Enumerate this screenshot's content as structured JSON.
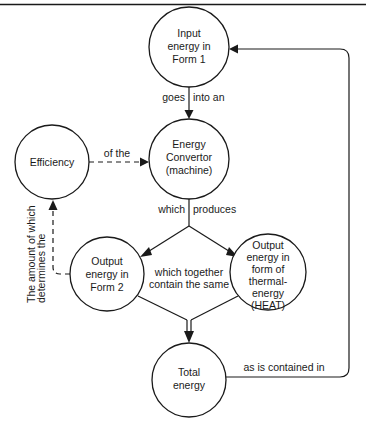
{
  "diagram": {
    "type": "concept-map",
    "nodes": [
      {
        "id": "input",
        "lines": [
          "Input",
          "energy in",
          "Form 1"
        ],
        "cx": 189,
        "cy": 47,
        "r": 40
      },
      {
        "id": "convertor",
        "lines": [
          "Energy",
          "Convertor",
          "(machine)"
        ],
        "cx": 189,
        "cy": 159,
        "r": 40
      },
      {
        "id": "efficiency",
        "lines": [
          "Efficiency"
        ],
        "cx": 52,
        "cy": 162,
        "r": 37
      },
      {
        "id": "output2",
        "lines": [
          "Output",
          "energy in",
          "Form 2"
        ],
        "cx": 107,
        "cy": 274,
        "r": 37
      },
      {
        "id": "heat",
        "lines": [
          "Output",
          "energy in",
          "form of",
          "thermal-",
          "energy",
          "(HEAT)"
        ],
        "cx": 268,
        "cy": 272,
        "r": 38
      },
      {
        "id": "total",
        "lines": [
          "Total",
          "energy"
        ],
        "cx": 189,
        "cy": 380,
        "r": 37
      }
    ],
    "edges": [
      {
        "from": "input",
        "to": "convertor",
        "style": "solid",
        "label_left": "goes",
        "label_right": "into an"
      },
      {
        "from": "efficiency",
        "to": "convertor",
        "style": "dashed",
        "label": "of the"
      },
      {
        "from": "convertor",
        "to": "output2",
        "style": "solid",
        "label_left": "which",
        "label_right": "produces"
      },
      {
        "from": "convertor",
        "to": "heat",
        "style": "solid"
      },
      {
        "from": "output2",
        "to": "efficiency",
        "style": "dashed",
        "label_lines": [
          "The amount of which",
          "determines the"
        ]
      },
      {
        "from": "output2",
        "to": "total",
        "style": "solid",
        "label_lines": [
          "which together",
          "contain the same"
        ]
      },
      {
        "from": "heat",
        "to": "total",
        "style": "solid"
      },
      {
        "from": "total",
        "to": "input",
        "style": "solid",
        "label": "as is contained in"
      }
    ]
  },
  "labels": {
    "input": {
      "l1": "Input",
      "l2": "energy in",
      "l3": "Form 1"
    },
    "convertor": {
      "l1": "Energy",
      "l2": "Convertor",
      "l3": "(machine)"
    },
    "efficiency": {
      "l1": "Efficiency"
    },
    "output2": {
      "l1": "Output",
      "l2": "energy in",
      "l3": "Form 2"
    },
    "heat": {
      "l1": "Output",
      "l2": "energy in",
      "l3": "form of",
      "l4": "thermal-",
      "l5": "energy",
      "l6": "(HEAT)"
    },
    "total": {
      "l1": "Total",
      "l2": "energy"
    },
    "edges": {
      "goes": "goes",
      "into_an": "into an",
      "of_the": "of the",
      "which": "which",
      "produces": "produces",
      "amount_l1": "The amount of which",
      "amount_l2": "determines the",
      "together_l1": "which together",
      "together_l2": "contain the same",
      "contained_in": "as is contained in"
    }
  }
}
